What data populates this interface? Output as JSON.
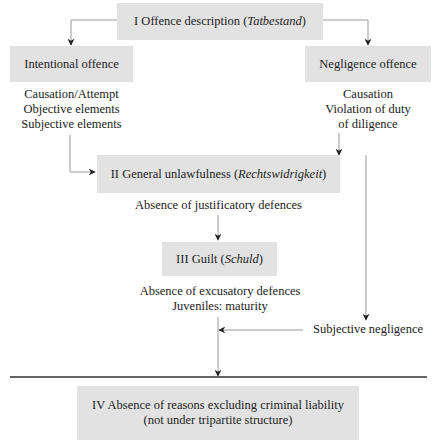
{
  "diagram": {
    "stage_1": {
      "label": "I Offence description (",
      "term": "Tatbestand",
      "close": ")"
    },
    "intentional": {
      "label": "Intentional offence",
      "elements": [
        "Causation/Attempt",
        "Objective elements",
        "Subjective elements"
      ]
    },
    "negligence": {
      "label": "Negligence offence",
      "elements": [
        "Causation",
        "Violation of duty",
        "of diligence"
      ],
      "subjective": "Subjective negligence"
    },
    "stage_2": {
      "label": "II  General unlawfulness (",
      "term": "Rechtswidrigkeit",
      "close": ")",
      "note": "Absence of justificatory defences"
    },
    "stage_3": {
      "label": "III  Guilt (",
      "term": "Schuld",
      "close": ")",
      "notes": [
        "Absence of excusatory defences",
        "Juveniles: maturity"
      ]
    },
    "stage_4": {
      "lines": [
        "IV  Absence of reasons excluding criminal liability",
        "(not under tripartite structure)"
      ]
    },
    "colors": {
      "box_fill": "#e2e2e2",
      "line": "#888888",
      "arrowhead": "#222222",
      "divider": "#333333"
    }
  }
}
